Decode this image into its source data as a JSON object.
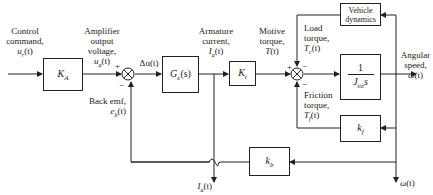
{
  "diagram": {
    "type": "block-diagram",
    "title": "",
    "blocks": [
      {
        "id": "ka",
        "label": "K_A",
        "text": "K",
        "sub": "A"
      },
      {
        "id": "ge",
        "label": "G_e(s)",
        "text": "G",
        "sub": "e",
        "after": "(s)"
      },
      {
        "id": "kt",
        "label": "K_t",
        "text": "K",
        "sub": "t"
      },
      {
        "id": "plant",
        "label": "1/(J_tot s)",
        "num": "1",
        "den_main": "J",
        "den_sub": "tot",
        "den_after": "s"
      },
      {
        "id": "vehicle",
        "label": "Vehicle dynamics",
        "line1": "Vehicle",
        "line2": "dynamics"
      },
      {
        "id": "kf",
        "label": "k_f",
        "text": "k",
        "sub": "f"
      },
      {
        "id": "kb",
        "label": "k_b",
        "text": "k",
        "sub": "b"
      }
    ],
    "signals": {
      "control": {
        "line1": "Control",
        "line2": "command,",
        "sym": "u",
        "sub": "r",
        "arg": "(t)"
      },
      "amp_out": {
        "line1": "Amplifier",
        "line2": "output",
        "line3": "voltage,",
        "sym": "u",
        "sub": "a",
        "arg": "(t)"
      },
      "delta_u": {
        "sym": "Δu",
        "arg": "(t)"
      },
      "armature": {
        "line1": "Armature",
        "line2": "current,",
        "sym": "I",
        "sub": "a",
        "arg": "(t)"
      },
      "motive": {
        "line1": "Motive",
        "line2": "torque,",
        "sym": "T",
        "arg": "(t)"
      },
      "load": {
        "line1": "Load",
        "line2": "torque,",
        "sym": "T",
        "sub": "c",
        "arg": "(t)"
      },
      "friction": {
        "line1": "Friction",
        "line2": "torque,",
        "sym": "T",
        "sub": "f",
        "arg": "(t)"
      },
      "back_emf": {
        "line1": "Back emf,",
        "sym": "e",
        "sub": "b",
        "arg": "(t)"
      },
      "angular": {
        "line1": "Angular",
        "line2": "speed,",
        "sym": "ω",
        "arg": "(t)"
      },
      "ia_out": {
        "sym": "I",
        "sub": "a",
        "arg": "(t)"
      },
      "omega_out": {
        "sym": "ω",
        "arg": "(t)"
      }
    },
    "signs": {
      "sum1_plus": "+",
      "sum1_minus": "−",
      "sum2_plus": "+",
      "sum2_minus_top": "−",
      "sum2_minus_bottom": "−"
    },
    "colors": {
      "line": "#222222",
      "background": "#ffffff"
    }
  }
}
